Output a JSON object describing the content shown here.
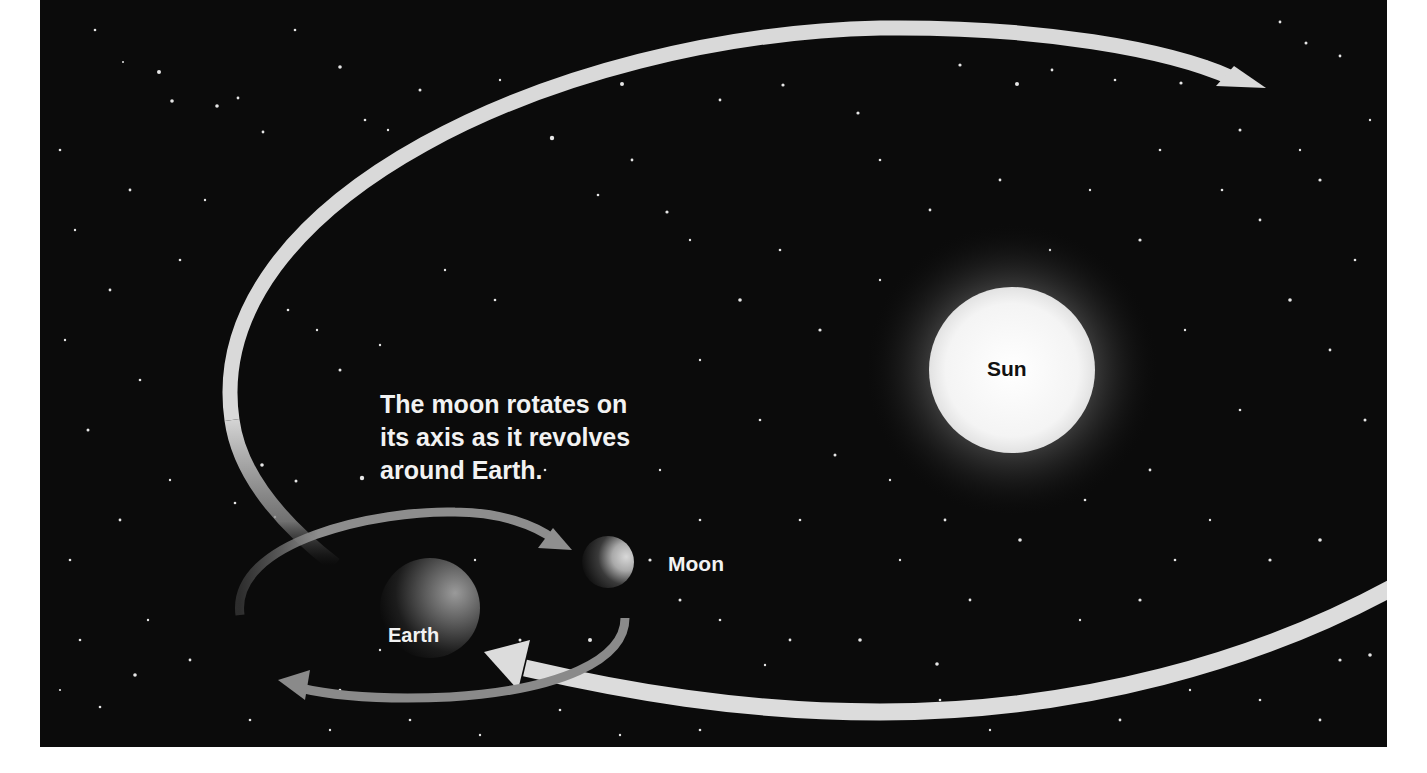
{
  "diagram": {
    "caption_lines": [
      "The moon rotates on",
      "its axis as it revolves",
      "around Earth."
    ],
    "labels": {
      "sun": "Sun",
      "earth": "Earth",
      "moon": "Moon"
    },
    "colors": {
      "background": "#0b0b0b",
      "orbit_path": "#d9d9d9",
      "moon_orbit": "#8f8f8f",
      "sun": "#f4f4f4",
      "caption_text": "#f2f2f2",
      "sun_label": "#111111"
    },
    "elements": [
      {
        "id": "sun",
        "shape": "circle",
        "cx": 1012,
        "cy": 370,
        "r": 83
      },
      {
        "id": "earth",
        "shape": "circle",
        "cx": 430,
        "cy": 608,
        "r": 50
      },
      {
        "id": "moon",
        "shape": "circle",
        "cx": 608,
        "cy": 562,
        "r": 26
      },
      {
        "id": "earth-orbit-around-sun",
        "shape": "arrow-path",
        "direction": "counterclockwise"
      },
      {
        "id": "moon-orbit-around-earth",
        "shape": "ellipse-arrow",
        "direction": "clockwise"
      }
    ]
  }
}
